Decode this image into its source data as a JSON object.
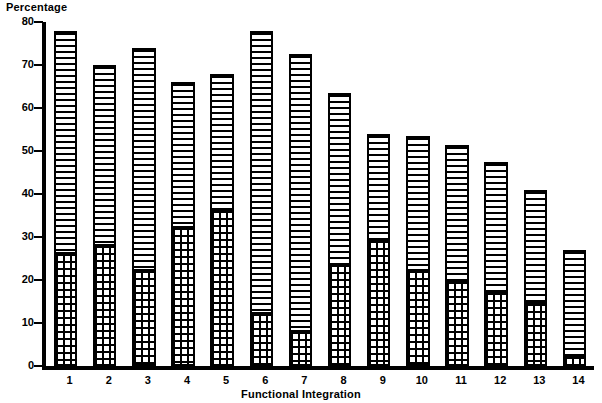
{
  "chart_data": {
    "type": "bar",
    "stacked": true,
    "title": "",
    "xlabel": "Functional Integration",
    "ylabel": "Percentage",
    "ylim": [
      0,
      80
    ],
    "yticks": [
      0,
      10,
      20,
      30,
      40,
      50,
      60,
      70,
      80
    ],
    "grid": false,
    "legend": "none",
    "categories": [
      "1",
      "2",
      "3",
      "4",
      "5",
      "6",
      "7",
      "8",
      "9",
      "10",
      "11",
      "12",
      "13",
      "14"
    ],
    "series": [
      {
        "name": "lower-segment",
        "fill": "cross-hatch",
        "values": [
          26,
          28,
          22,
          32,
          36,
          12,
          8,
          23.5,
          29,
          22,
          19.5,
          17,
          14.5,
          2
        ]
      },
      {
        "name": "upper-segment",
        "fill": "horizontal-lines",
        "values": [
          52,
          42,
          52,
          34,
          32,
          66,
          64.5,
          40,
          25,
          31.5,
          32,
          30.5,
          26.5,
          25
        ]
      }
    ],
    "totals": [
      78,
      70,
      74,
      66,
      68,
      78,
      72.5,
      63.5,
      54,
      53.5,
      51.5,
      47.5,
      41,
      27
    ]
  },
  "axis": {
    "y_title": "Percentage",
    "x_title": "Functional Integration",
    "y_tick_labels": [
      "80",
      "70",
      "60",
      "50",
      "40",
      "30",
      "20",
      "10",
      "0"
    ],
    "x_tick_labels": [
      "1",
      "2",
      "3",
      "4",
      "5",
      "6",
      "7",
      "8",
      "9",
      "10",
      "11",
      "12",
      "13",
      "14"
    ]
  },
  "colors": {
    "ink": "#000000",
    "paper": "#ffffff"
  }
}
